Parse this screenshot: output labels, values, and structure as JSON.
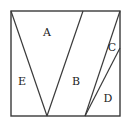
{
  "diagram": {
    "type": "geometric-partition",
    "square": {
      "x1": 11,
      "y1": 11,
      "x2": 120,
      "y2": 116
    },
    "lines": [
      {
        "id": "v-left",
        "from": [
          11,
          11
        ],
        "to": [
          47,
          116
        ]
      },
      {
        "id": "v-right",
        "from": [
          83,
          11
        ],
        "to": [
          47,
          116
        ]
      },
      {
        "id": "outer-diagonal",
        "from": [
          120,
          11
        ],
        "to": [
          85,
          116
        ]
      },
      {
        "id": "inner-diagonal",
        "from": [
          120,
          48
        ],
        "to": [
          85,
          116
        ]
      }
    ],
    "regions": [
      {
        "label": "A",
        "x": 47,
        "y": 36
      },
      {
        "label": "B",
        "x": 76,
        "y": 85
      },
      {
        "label": "C",
        "x": 112,
        "y": 51
      },
      {
        "label": "D",
        "x": 108,
        "y": 102
      },
      {
        "label": "E",
        "x": 22,
        "y": 85
      }
    ],
    "colors": {
      "stroke": "#3a3a3a",
      "text": "#222222",
      "background": "#ffffff"
    }
  }
}
